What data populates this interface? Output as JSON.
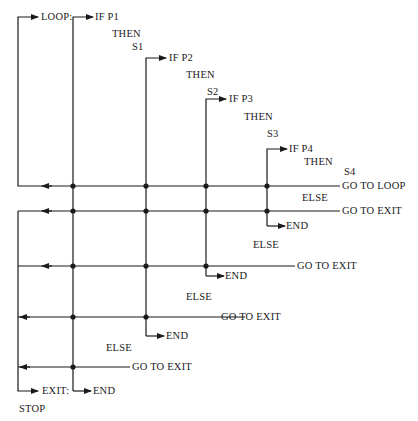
{
  "diagram": {
    "type": "flowchart-nested-if",
    "labels": {
      "loop": "LOOP:",
      "if_p1": "IF P1",
      "then1": "THEN",
      "s1": "S1",
      "if_p2": "IF P2",
      "then2": "THEN",
      "s2": "S2",
      "if_p3": "IF P3",
      "then3": "THEN",
      "s3": "S3",
      "if_p4": "IF P4",
      "then4": "THEN",
      "s4": "S4",
      "goto_loop": "GO TO LOOP",
      "else4": "ELSE",
      "goto_exit4": "GO  TO  EXIT",
      "end4": "END",
      "else3": "ELSE",
      "goto_exit3": "GO  TO  EXIT",
      "end3": "END",
      "else2": "ELSE",
      "goto_exit2": "GO TO EXIT",
      "end2": "END",
      "else1": "ELSE",
      "goto_exit1": "GO TO EXIT",
      "exit": "EXIT:",
      "end1": "END",
      "stop": "STOP"
    },
    "colors": {
      "line": "#1a1a1a",
      "background": "#ffffff"
    }
  }
}
